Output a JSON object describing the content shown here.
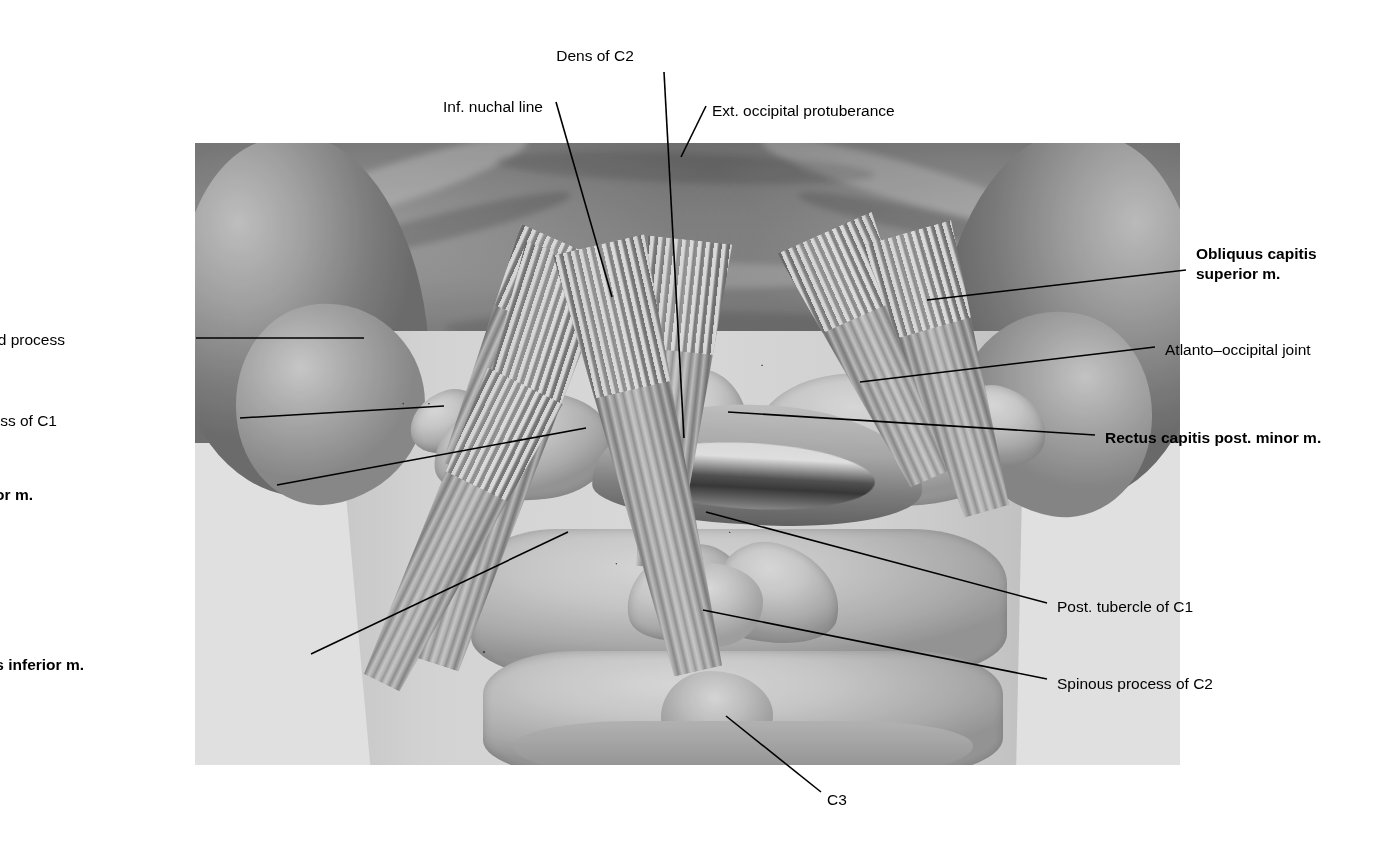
{
  "figure": {
    "kind": "anatomical-illustration",
    "region": "Suboccipital region, posterior view",
    "style": "grayscale halftone medical illustration",
    "background_color": "#ffffff",
    "label_color": "#000000",
    "leader_line_color": "#000000",
    "plate": {
      "x": 195,
      "y": 143,
      "width": 985,
      "height": 622
    }
  },
  "labels": [
    {
      "id": "dens-of-c2",
      "text": "Dens of C2",
      "bold": false,
      "align": "center",
      "x": 595,
      "y": 46,
      "leader": [
        [
          664,
          72
        ],
        [
          684,
          438
        ]
      ]
    },
    {
      "id": "inf-nuchal-line",
      "text": "Inf. nuchal line",
      "bold": false,
      "align": "left",
      "x": 443,
      "y": 97,
      "leader": [
        [
          556,
          102
        ],
        [
          612,
          297
        ]
      ]
    },
    {
      "id": "ext-occipital-protuberance",
      "text": "Ext. occipital protuberance",
      "bold": false,
      "align": "left",
      "x": 712,
      "y": 101,
      "leader": [
        [
          706,
          106
        ],
        [
          681,
          157
        ]
      ]
    },
    {
      "id": "obliquus-capitis-superior-m",
      "text": "Obliquus capitis\nsuperior m.",
      "bold": true,
      "align": "left",
      "x": 1196,
      "y": 244,
      "leader": [
        [
          1186,
          270
        ],
        [
          927,
          300
        ]
      ]
    },
    {
      "id": "mastoid-process",
      "text": "Mastoid process",
      "bold": false,
      "align": "right",
      "x": 65,
      "y": 330,
      "leader": [
        [
          196,
          338
        ],
        [
          364,
          338
        ]
      ]
    },
    {
      "id": "atlanto-occipital-joint",
      "text": "Atlanto–occipital joint",
      "bold": false,
      "align": "left",
      "x": 1165,
      "y": 340,
      "leader": [
        [
          1155,
          347
        ],
        [
          860,
          382
        ]
      ]
    },
    {
      "id": "transverse-process-of-c1",
      "text": "Transverse process of C1",
      "bold": false,
      "align": "right",
      "x": 57,
      "y": 411,
      "leader": [
        [
          240,
          418
        ],
        [
          444,
          406
        ]
      ]
    },
    {
      "id": "rectus-capitis-post-minor-m",
      "text": "Rectus capitis post. minor m.",
      "bold": true,
      "align": "left",
      "x": 1105,
      "y": 428,
      "leader": [
        [
          1095,
          435
        ],
        [
          728,
          412
        ]
      ]
    },
    {
      "id": "rectus-capitis-post-major-m",
      "text": "Rectus capitis post. major m.",
      "bold": true,
      "align": "right",
      "x": 33,
      "y": 485,
      "leader": [
        [
          277,
          485
        ],
        [
          586,
          428
        ]
      ]
    },
    {
      "id": "post-tubercle-of-c1",
      "text": "Post. tubercle of C1",
      "bold": false,
      "align": "left",
      "x": 1057,
      "y": 597,
      "leader": [
        [
          1047,
          603
        ],
        [
          706,
          512
        ]
      ]
    },
    {
      "id": "spinous-process-of-c2",
      "text": "Spinous process of C2",
      "bold": false,
      "align": "left",
      "x": 1057,
      "y": 674,
      "leader": [
        [
          1047,
          679
        ],
        [
          703,
          610
        ]
      ]
    },
    {
      "id": "obliquus-capitis-inferior-m",
      "text": "Obliquus capitis inferior m.",
      "bold": true,
      "align": "right",
      "x": 84,
      "y": 655,
      "leader": [
        [
          311,
          654
        ],
        [
          568,
          532
        ]
      ]
    },
    {
      "id": "c3",
      "text": "C3",
      "bold": false,
      "align": "left",
      "x": 827,
      "y": 790,
      "leader": [
        [
          821,
          792
        ],
        [
          726,
          716
        ]
      ]
    }
  ],
  "structures": {
    "muscles": [
      "Obliquus capitis superior m.",
      "Obliquus capitis inferior m.",
      "Rectus capitis post. major m.",
      "Rectus capitis post. minor m."
    ],
    "bony_landmarks": [
      "Dens of C2",
      "Inf. nuchal line",
      "Ext. occipital protuberance",
      "Mastoid process",
      "Atlanto–occipital joint",
      "Transverse process of C1",
      "Post. tubercle of C1",
      "Spinous process of C2",
      "C3"
    ]
  }
}
